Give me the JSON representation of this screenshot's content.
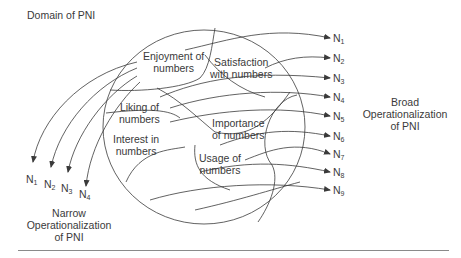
{
  "title": "Domain of PNI",
  "regions": [
    {
      "label": "Enjoyment of numbers",
      "line1": "Enjoyment of",
      "line2": "numbers"
    },
    {
      "label": "Satisfaction with numbers",
      "line1": "Satisfaction",
      "line2": "with numbers"
    },
    {
      "label": "Liking of numbers",
      "line1": "Liking of",
      "line2": "numbers"
    },
    {
      "label": "Importance of numbers",
      "line1": "Importance",
      "line2": "of numbers"
    },
    {
      "label": "Interest in numbers",
      "line1": "Interest in",
      "line2": "numbers"
    },
    {
      "label": "Usage of numbers",
      "line1": "Usage of",
      "line2": "numbers"
    }
  ],
  "broad": {
    "items": [
      {
        "base": "N",
        "sub": "1"
      },
      {
        "base": "N",
        "sub": "2"
      },
      {
        "base": "N",
        "sub": "3"
      },
      {
        "base": "N",
        "sub": "4"
      },
      {
        "base": "N",
        "sub": "5"
      },
      {
        "base": "N",
        "sub": "6"
      },
      {
        "base": "N",
        "sub": "7"
      },
      {
        "base": "N",
        "sub": "8"
      },
      {
        "base": "N",
        "sub": "9"
      }
    ],
    "caption_line1": "Broad",
    "caption_line2": "Operationalization",
    "caption_line3": "of PNI"
  },
  "narrow": {
    "items": [
      {
        "base": "N",
        "sub": "1"
      },
      {
        "base": "N",
        "sub": "2"
      },
      {
        "base": "N",
        "sub": "3"
      },
      {
        "base": "N",
        "sub": "4"
      }
    ],
    "caption_line1": "Narrow",
    "caption_line2": "Operationalization",
    "caption_line3": "of PNI"
  },
  "colors": {
    "stroke": "#3a3a3a",
    "text": "#3a3a3a",
    "rule": "#8a8a8a"
  }
}
